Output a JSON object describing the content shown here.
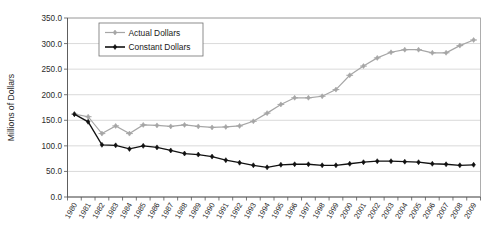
{
  "chart_data": {
    "type": "line",
    "title": "",
    "xlabel": "",
    "ylabel": "Millions of Dollars",
    "ylim": [
      0,
      350
    ],
    "ytick_values": [
      0,
      50,
      100,
      150,
      200,
      250,
      300,
      350
    ],
    "ytick_labels": [
      "0.0",
      "50.0",
      "100.0",
      "150.0",
      "200.0",
      "250.0",
      "300.0",
      "350.0"
    ],
    "grid": true,
    "legend_position": "top-left-inside",
    "categories": [
      "1980",
      "1981",
      "1982",
      "1983",
      "1984",
      "1985",
      "1986",
      "1987",
      "1988",
      "1989",
      "1990",
      "1991",
      "1992",
      "1993",
      "1994",
      "1995",
      "1996",
      "1997",
      "1998",
      "1999",
      "2000",
      "2001",
      "2002",
      "2003",
      "2004",
      "2005",
      "2006",
      "2007",
      "2008",
      "2009"
    ],
    "x": [
      1980,
      1981,
      1982,
      1983,
      1984,
      1985,
      1986,
      1987,
      1988,
      1989,
      1990,
      1991,
      1992,
      1993,
      1994,
      1995,
      1996,
      1997,
      1998,
      1999,
      2000,
      2001,
      2002,
      2003,
      2004,
      2005,
      2006,
      2007,
      2008,
      2009
    ],
    "series": [
      {
        "name": "Actual Dollars",
        "color": "#a6a6a6",
        "marker": "diamond",
        "values": [
          162.0,
          157.0,
          124.0,
          139.0,
          124.0,
          141.0,
          140.0,
          138.0,
          141.0,
          138.0,
          136.0,
          137.0,
          139.0,
          148.0,
          164.0,
          181.0,
          194.0,
          194.0,
          197.0,
          210.0,
          238.0,
          256.0,
          272.0,
          283.0,
          288.0,
          288.0,
          282.0,
          282.0,
          296.0,
          307.0
        ]
      },
      {
        "name": "Constant Dollars",
        "color": "#111111",
        "marker": "diamond-filled",
        "values": [
          162.0,
          147.0,
          102.0,
          101.0,
          94.0,
          100.0,
          97.0,
          91.0,
          85.0,
          83.0,
          79.0,
          72.0,
          67.0,
          62.0,
          58.0,
          63.0,
          64.0,
          64.0,
          62.0,
          62.0,
          65.0,
          68.0,
          70.0,
          70.0,
          69.0,
          68.0,
          65.0,
          64.0,
          62.0,
          63.0
        ]
      }
    ]
  },
  "legend": {
    "items": [
      {
        "label": "Actual Dollars"
      },
      {
        "label": "Constant Dollars"
      }
    ]
  }
}
